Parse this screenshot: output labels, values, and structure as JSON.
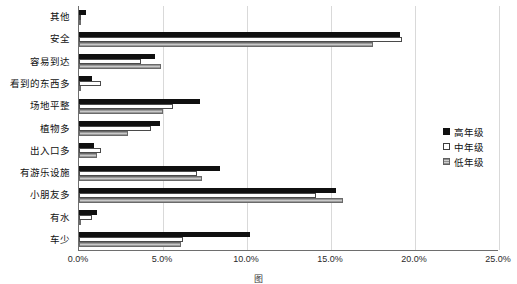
{
  "chart_data": {
    "type": "bar",
    "orientation": "horizontal",
    "title": "",
    "subtitle": "",
    "xlabel": "",
    "ylabel": "",
    "xlim": [
      0,
      25
    ],
    "xtick_labels": [
      "0.0%",
      "5.0%",
      "10.0%",
      "15.0%",
      "20.0%",
      "25.0%"
    ],
    "xtick_values": [
      0,
      5,
      10,
      15,
      20,
      25
    ],
    "grid": true,
    "grid_axis": "x",
    "legend_position": "right",
    "value_unit": "%",
    "categories": [
      "其他",
      "安全",
      "容易到达",
      "看到的东西多",
      "场地平整",
      "植物多",
      "出入口多",
      "有游乐设施",
      "小朋友多",
      "有水",
      "车少"
    ],
    "series": [
      {
        "name": "高年级",
        "color": "#101010",
        "pattern": "solid",
        "values": [
          0.4,
          19.1,
          4.5,
          0.8,
          7.2,
          4.8,
          0.9,
          8.4,
          15.3,
          1.1,
          10.2
        ]
      },
      {
        "name": "中年级",
        "color": "#ffffff",
        "pattern": "hollow",
        "values": [
          0.0,
          19.2,
          3.7,
          1.3,
          5.6,
          4.3,
          1.3,
          7.0,
          14.1,
          0.8,
          6.2
        ]
      },
      {
        "name": "低年级",
        "color": "#b4b4b4",
        "pattern": "hatched",
        "values": [
          0.0,
          17.5,
          4.9,
          0.0,
          5.0,
          2.9,
          1.1,
          7.3,
          15.7,
          0.1,
          6.1
        ]
      }
    ]
  },
  "legend": {
    "entries": [
      {
        "label": "高年级"
      },
      {
        "label": "中年级"
      },
      {
        "label": "低年级"
      }
    ]
  },
  "caption": {
    "text": "图"
  }
}
